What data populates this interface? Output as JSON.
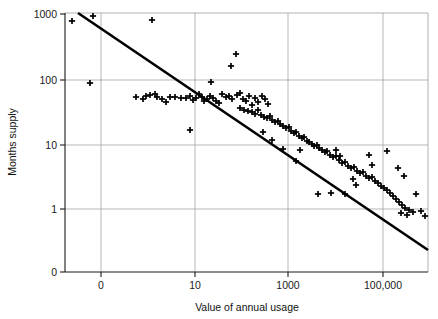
{
  "chart_data": {
    "type": "scatter",
    "title": "",
    "xlabel": "Value of annual usage",
    "ylabel": "Months supply",
    "x_scale": "log",
    "y_scale": "log",
    "grid": true,
    "legend": null,
    "x_ticks": [
      {
        "label": "0",
        "value": 1
      },
      {
        "label": "10",
        "value": 100
      },
      {
        "label": "1000",
        "value": 10000
      },
      {
        "label": "100,000",
        "value": 1000000
      }
    ],
    "y_ticks": [
      {
        "label": "1000",
        "value": 1000
      },
      {
        "label": "100",
        "value": 100
      },
      {
        "label": "10",
        "value": 10
      },
      {
        "label": "1",
        "value": 1
      },
      {
        "label": "0",
        "value": 0
      }
    ],
    "marker": "plus",
    "marker_color": "#000000",
    "line_color": "#000000",
    "grid_color": "#9a9a9a",
    "trend_line": {
      "label": "fitted trend line",
      "start": {
        "x_px": 78,
        "y_px": 13
      },
      "end": {
        "x_px": 428,
        "y_px": 250
      }
    },
    "points_px": [
      [
        72,
        21
      ],
      [
        93,
        16
      ],
      [
        152,
        20
      ],
      [
        90,
        83
      ],
      [
        231,
        66
      ],
      [
        211,
        82
      ],
      [
        236,
        54
      ],
      [
        136,
        97
      ],
      [
        143,
        99
      ],
      [
        146,
        96
      ],
      [
        150,
        95
      ],
      [
        155,
        94
      ],
      [
        157,
        97
      ],
      [
        162,
        99
      ],
      [
        166,
        102
      ],
      [
        170,
        97
      ],
      [
        175,
        97
      ],
      [
        181,
        98
      ],
      [
        186,
        98
      ],
      [
        190,
        96
      ],
      [
        193,
        100
      ],
      [
        196,
        98
      ],
      [
        199,
        94
      ],
      [
        202,
        97
      ],
      [
        204,
        101
      ],
      [
        207,
        99
      ],
      [
        210,
        96
      ],
      [
        213,
        98
      ],
      [
        216,
        101
      ],
      [
        219,
        103
      ],
      [
        190,
        130
      ],
      [
        222,
        94
      ],
      [
        226,
        97
      ],
      [
        229,
        96
      ],
      [
        232,
        99
      ],
      [
        237,
        95
      ],
      [
        240,
        93
      ],
      [
        243,
        99
      ],
      [
        246,
        101
      ],
      [
        249,
        96
      ],
      [
        252,
        105
      ],
      [
        255,
        98
      ],
      [
        258,
        102
      ],
      [
        262,
        96
      ],
      [
        265,
        99
      ],
      [
        268,
        104
      ],
      [
        240,
        108
      ],
      [
        244,
        110
      ],
      [
        248,
        111
      ],
      [
        252,
        112
      ],
      [
        255,
        114
      ],
      [
        258,
        110
      ],
      [
        261,
        115
      ],
      [
        264,
        117
      ],
      [
        267,
        118
      ],
      [
        270,
        116
      ],
      [
        272,
        120
      ],
      [
        275,
        122
      ],
      [
        278,
        121
      ],
      [
        280,
        124
      ],
      [
        283,
        126
      ],
      [
        286,
        128
      ],
      [
        289,
        127
      ],
      [
        291,
        131
      ],
      [
        294,
        133
      ],
      [
        296,
        132
      ],
      [
        299,
        136
      ],
      [
        302,
        138
      ],
      [
        304,
        137
      ],
      [
        307,
        141
      ],
      [
        309,
        142
      ],
      [
        312,
        144
      ],
      [
        314,
        146
      ],
      [
        317,
        145
      ],
      [
        319,
        148
      ],
      [
        322,
        150
      ],
      [
        325,
        152
      ],
      [
        327,
        151
      ],
      [
        330,
        155
      ],
      [
        333,
        157
      ],
      [
        336,
        156
      ],
      [
        339,
        160
      ],
      [
        342,
        163
      ],
      [
        345,
        162
      ],
      [
        348,
        166
      ],
      [
        351,
        168
      ],
      [
        354,
        167
      ],
      [
        357,
        171
      ],
      [
        360,
        173
      ],
      [
        363,
        172
      ],
      [
        366,
        176
      ],
      [
        369,
        178
      ],
      [
        372,
        177
      ],
      [
        375,
        181
      ],
      [
        378,
        183
      ],
      [
        381,
        186
      ],
      [
        384,
        188
      ],
      [
        387,
        190
      ],
      [
        390,
        193
      ],
      [
        393,
        196
      ],
      [
        396,
        199
      ],
      [
        399,
        202
      ],
      [
        402,
        205
      ],
      [
        405,
        208
      ],
      [
        409,
        210
      ],
      [
        413,
        212
      ],
      [
        318,
        194
      ],
      [
        331,
        193
      ],
      [
        345,
        194
      ],
      [
        353,
        179
      ],
      [
        356,
        185
      ],
      [
        369,
        155
      ],
      [
        372,
        165
      ],
      [
        387,
        151
      ],
      [
        398,
        168
      ],
      [
        404,
        176
      ],
      [
        416,
        194
      ],
      [
        421,
        211
      ],
      [
        425,
        216
      ],
      [
        401,
        213
      ],
      [
        407,
        215
      ],
      [
        336,
        150
      ],
      [
        340,
        156
      ],
      [
        296,
        161
      ],
      [
        300,
        150
      ],
      [
        283,
        149
      ],
      [
        263,
        132
      ],
      [
        272,
        140
      ]
    ],
    "plot_box_px": {
      "left": 65,
      "top": 13,
      "right": 428,
      "bottom": 272
    },
    "x_gridlines_px": [
      101,
      195,
      288,
      383
    ],
    "y_gridlines_px": [
      80,
      145,
      209
    ]
  }
}
